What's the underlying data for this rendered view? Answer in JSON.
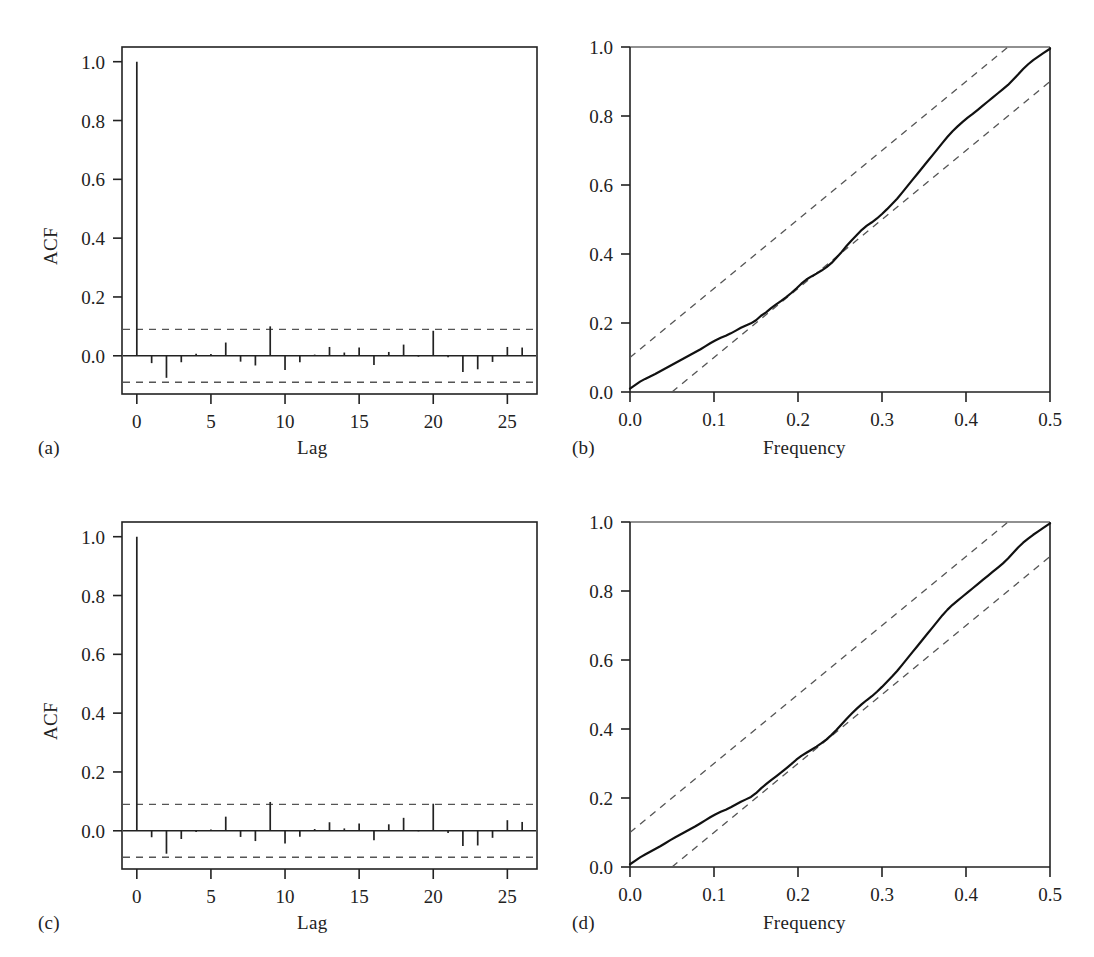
{
  "figure": {
    "panels": [
      {
        "id": "a",
        "label": "(a)",
        "kind": "acf",
        "x_axis_title": "Lag",
        "y_axis_title": "ACF"
      },
      {
        "id": "b",
        "label": "(b)",
        "kind": "cpgram",
        "x_axis_title": "Frequency",
        "y_axis_title": ""
      },
      {
        "id": "c",
        "label": "(c)",
        "kind": "acf",
        "x_axis_title": "Lag",
        "y_axis_title": "ACF"
      },
      {
        "id": "d",
        "label": "(d)",
        "kind": "cpgram",
        "x_axis_title": "Frequency",
        "y_axis_title": ""
      }
    ]
  },
  "chart_data": [
    {
      "type": "bar",
      "panel": "a",
      "title": "",
      "xlabel": "Lag",
      "ylabel": "ACF",
      "xlim": [
        -1,
        27
      ],
      "ylim": [
        -0.13,
        1.05
      ],
      "xticks": [
        0,
        5,
        10,
        15,
        20,
        25
      ],
      "xtick_labels": [
        "0",
        "5",
        "10",
        "15",
        "20",
        "25"
      ],
      "yticks": [
        0.0,
        0.2,
        0.4,
        0.6,
        0.8,
        1.0
      ],
      "ytick_labels": [
        "0.0",
        "0.2",
        "0.4",
        "0.6",
        "0.8",
        "1.0"
      ],
      "grid": false,
      "legend": "none",
      "confidence_band": 0.09,
      "confidence_band_style": "dashed",
      "categories": [
        0,
        1,
        2,
        3,
        4,
        5,
        6,
        7,
        8,
        9,
        10,
        11,
        12,
        13,
        14,
        15,
        16,
        17,
        18,
        19,
        20,
        21,
        22,
        23,
        24,
        25,
        26
      ],
      "values": [
        1.0,
        -0.025,
        -0.075,
        -0.022,
        0.007,
        0.006,
        0.045,
        -0.02,
        -0.033,
        0.1,
        -0.048,
        -0.022,
        0.004,
        0.03,
        0.011,
        0.028,
        -0.031,
        0.013,
        0.038,
        -0.003,
        0.085,
        -0.005,
        -0.055,
        -0.046,
        -0.021,
        0.03,
        0.028
      ]
    },
    {
      "type": "line",
      "panel": "b",
      "title": "",
      "xlabel": "Frequency",
      "ylabel": "",
      "xlim": [
        0.0,
        0.5
      ],
      "ylim": [
        0.0,
        1.0
      ],
      "xticks": [
        0.0,
        0.1,
        0.2,
        0.3,
        0.4,
        0.5
      ],
      "xtick_labels": [
        "0.0",
        "0.1",
        "0.2",
        "0.3",
        "0.4",
        "0.5"
      ],
      "yticks": [
        0.0,
        0.2,
        0.4,
        0.6,
        0.8,
        1.0
      ],
      "ytick_labels": [
        "0.0",
        "0.2",
        "0.4",
        "0.6",
        "0.8",
        "1.0"
      ],
      "grid": false,
      "legend": "none",
      "bands": {
        "style": "dashed",
        "upper": {
          "x": [
            0.0,
            0.45
          ],
          "y": [
            0.1,
            1.0
          ]
        },
        "lower": {
          "x": [
            0.05,
            0.5
          ],
          "y": [
            0.0,
            0.9
          ]
        }
      },
      "series": [
        {
          "name": "cumulative periodogram",
          "x": [
            0.0,
            0.006,
            0.012,
            0.018,
            0.024,
            0.03,
            0.036,
            0.042,
            0.048,
            0.054,
            0.06,
            0.066,
            0.072,
            0.078,
            0.084,
            0.09,
            0.096,
            0.102,
            0.108,
            0.114,
            0.12,
            0.126,
            0.132,
            0.138,
            0.144,
            0.15,
            0.156,
            0.162,
            0.168,
            0.174,
            0.18,
            0.186,
            0.192,
            0.198,
            0.204,
            0.21,
            0.216,
            0.222,
            0.228,
            0.234,
            0.24,
            0.246,
            0.252,
            0.258,
            0.264,
            0.27,
            0.276,
            0.282,
            0.288,
            0.294,
            0.3,
            0.306,
            0.312,
            0.318,
            0.324,
            0.33,
            0.336,
            0.342,
            0.348,
            0.354,
            0.36,
            0.366,
            0.372,
            0.378,
            0.384,
            0.39,
            0.396,
            0.402,
            0.408,
            0.414,
            0.42,
            0.426,
            0.432,
            0.438,
            0.444,
            0.45,
            0.456,
            0.462,
            0.468,
            0.474,
            0.48,
            0.486,
            0.492,
            0.5
          ],
          "y": [
            0.01,
            0.02,
            0.03,
            0.038,
            0.045,
            0.052,
            0.06,
            0.068,
            0.076,
            0.084,
            0.092,
            0.1,
            0.108,
            0.116,
            0.124,
            0.133,
            0.142,
            0.15,
            0.157,
            0.163,
            0.17,
            0.178,
            0.186,
            0.193,
            0.199,
            0.208,
            0.221,
            0.231,
            0.243,
            0.254,
            0.264,
            0.275,
            0.287,
            0.3,
            0.314,
            0.326,
            0.335,
            0.343,
            0.352,
            0.362,
            0.374,
            0.39,
            0.406,
            0.424,
            0.44,
            0.455,
            0.47,
            0.482,
            0.492,
            0.503,
            0.516,
            0.53,
            0.545,
            0.56,
            0.578,
            0.596,
            0.614,
            0.632,
            0.65,
            0.668,
            0.686,
            0.704,
            0.722,
            0.74,
            0.756,
            0.77,
            0.783,
            0.795,
            0.806,
            0.818,
            0.83,
            0.842,
            0.854,
            0.866,
            0.878,
            0.89,
            0.905,
            0.92,
            0.936,
            0.95,
            0.962,
            0.972,
            0.982,
            0.995
          ]
        }
      ]
    },
    {
      "type": "bar",
      "panel": "c",
      "title": "",
      "xlabel": "Lag",
      "ylabel": "ACF",
      "xlim": [
        -1,
        27
      ],
      "ylim": [
        -0.13,
        1.05
      ],
      "xticks": [
        0,
        5,
        10,
        15,
        20,
        25
      ],
      "xtick_labels": [
        "0",
        "5",
        "10",
        "15",
        "20",
        "25"
      ],
      "yticks": [
        0.0,
        0.2,
        0.4,
        0.6,
        0.8,
        1.0
      ],
      "ytick_labels": [
        "0.0",
        "0.2",
        "0.4",
        "0.6",
        "0.8",
        "1.0"
      ],
      "grid": false,
      "legend": "none",
      "confidence_band": 0.09,
      "confidence_band_style": "dashed",
      "categories": [
        0,
        1,
        2,
        3,
        4,
        5,
        6,
        7,
        8,
        9,
        10,
        11,
        12,
        13,
        14,
        15,
        16,
        17,
        18,
        19,
        20,
        21,
        22,
        23,
        24,
        25,
        26
      ],
      "values": [
        1.0,
        -0.022,
        -0.078,
        -0.028,
        -0.004,
        0.004,
        0.048,
        -0.021,
        -0.035,
        0.098,
        -0.043,
        -0.02,
        0.006,
        0.029,
        0.008,
        0.025,
        -0.032,
        0.022,
        0.044,
        -0.002,
        0.092,
        -0.008,
        -0.052,
        -0.05,
        -0.024,
        0.036,
        0.03
      ]
    },
    {
      "type": "line",
      "panel": "d",
      "title": "",
      "xlabel": "Frequency",
      "ylabel": "",
      "xlim": [
        0.0,
        0.5
      ],
      "ylim": [
        0.0,
        1.0
      ],
      "xticks": [
        0.0,
        0.1,
        0.2,
        0.3,
        0.4,
        0.5
      ],
      "xtick_labels": [
        "0.0",
        "0.1",
        "0.2",
        "0.3",
        "0.4",
        "0.5"
      ],
      "yticks": [
        0.0,
        0.2,
        0.4,
        0.6,
        0.8,
        1.0
      ],
      "ytick_labels": [
        "0.0",
        "0.2",
        "0.4",
        "0.6",
        "0.8",
        "1.0"
      ],
      "grid": false,
      "legend": "none",
      "bands": {
        "style": "dashed",
        "upper": {
          "x": [
            0.0,
            0.45
          ],
          "y": [
            0.1,
            1.0
          ]
        },
        "lower": {
          "x": [
            0.05,
            0.5
          ],
          "y": [
            0.0,
            0.9
          ]
        }
      },
      "series": [
        {
          "name": "cumulative periodogram",
          "x": [
            0.0,
            0.006,
            0.012,
            0.018,
            0.024,
            0.03,
            0.036,
            0.042,
            0.048,
            0.054,
            0.06,
            0.066,
            0.072,
            0.078,
            0.084,
            0.09,
            0.096,
            0.102,
            0.108,
            0.114,
            0.12,
            0.126,
            0.132,
            0.138,
            0.144,
            0.15,
            0.156,
            0.162,
            0.168,
            0.174,
            0.18,
            0.186,
            0.192,
            0.198,
            0.204,
            0.21,
            0.216,
            0.222,
            0.228,
            0.234,
            0.24,
            0.246,
            0.252,
            0.258,
            0.264,
            0.27,
            0.276,
            0.282,
            0.288,
            0.294,
            0.3,
            0.306,
            0.312,
            0.318,
            0.324,
            0.33,
            0.336,
            0.342,
            0.348,
            0.354,
            0.36,
            0.366,
            0.372,
            0.378,
            0.384,
            0.39,
            0.396,
            0.402,
            0.408,
            0.414,
            0.42,
            0.426,
            0.432,
            0.438,
            0.444,
            0.45,
            0.456,
            0.462,
            0.468,
            0.474,
            0.48,
            0.486,
            0.492,
            0.5
          ],
          "y": [
            0.008,
            0.018,
            0.028,
            0.036,
            0.044,
            0.052,
            0.06,
            0.069,
            0.078,
            0.086,
            0.094,
            0.102,
            0.11,
            0.118,
            0.127,
            0.136,
            0.145,
            0.153,
            0.16,
            0.166,
            0.173,
            0.181,
            0.189,
            0.196,
            0.203,
            0.214,
            0.228,
            0.24,
            0.252,
            0.263,
            0.274,
            0.286,
            0.298,
            0.311,
            0.322,
            0.331,
            0.34,
            0.349,
            0.359,
            0.37,
            0.383,
            0.398,
            0.414,
            0.43,
            0.445,
            0.459,
            0.472,
            0.484,
            0.495,
            0.508,
            0.522,
            0.537,
            0.552,
            0.568,
            0.586,
            0.604,
            0.622,
            0.64,
            0.658,
            0.676,
            0.694,
            0.712,
            0.73,
            0.746,
            0.76,
            0.772,
            0.784,
            0.796,
            0.808,
            0.82,
            0.832,
            0.844,
            0.856,
            0.868,
            0.88,
            0.894,
            0.91,
            0.926,
            0.94,
            0.952,
            0.963,
            0.973,
            0.983,
            0.996
          ]
        }
      ]
    }
  ]
}
